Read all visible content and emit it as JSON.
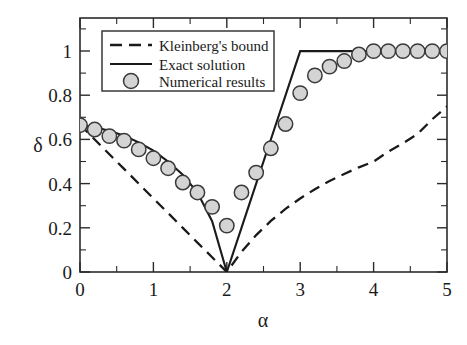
{
  "chart_data": {
    "type": "line",
    "title": "",
    "xlabel": "α",
    "ylabel": "δ",
    "xlim": [
      0,
      5
    ],
    "ylim": [
      0,
      1.15
    ],
    "grid": false,
    "legend_position": "top-left",
    "xticks": [
      0,
      1,
      2,
      3,
      4,
      5
    ],
    "xtick_labels": [
      "0",
      "1",
      "2",
      "3",
      "4",
      "5"
    ],
    "xminor_ticks": [
      0.5,
      1.5,
      2.5,
      3.5,
      4.5
    ],
    "yticks": [
      0,
      0.2,
      0.4,
      0.6,
      0.8,
      1
    ],
    "ytick_labels": [
      "0",
      "0.2",
      "0.4",
      "0.6",
      "0.8",
      "1"
    ],
    "yminor_ticks": [
      0.1,
      0.3,
      0.5,
      0.7,
      0.9,
      1.1
    ],
    "series": [
      {
        "name": "Kleinberg's bound",
        "style": "dashed",
        "color": "#1a1a1a",
        "x": [
          0,
          0.2,
          0.4,
          0.6,
          0.8,
          1.0,
          1.2,
          1.4,
          1.6,
          1.8,
          2.0,
          2.2,
          2.4,
          2.6,
          2.8,
          3.0,
          3.2,
          3.4,
          3.6,
          3.8,
          4.0,
          4.2,
          4.4,
          4.6,
          4.8,
          5.0
        ],
        "y": [
          0.667,
          0.6,
          0.533,
          0.467,
          0.4,
          0.333,
          0.267,
          0.2,
          0.133,
          0.067,
          0.0,
          0.091,
          0.167,
          0.231,
          0.286,
          0.333,
          0.375,
          0.412,
          0.444,
          0.474,
          0.5,
          0.545,
          0.583,
          0.625,
          0.692,
          0.75
        ]
      },
      {
        "name": "Exact solution",
        "style": "solid",
        "color": "#1a1a1a",
        "x": [
          0,
          0.2,
          0.4,
          0.6,
          0.8,
          1.0,
          1.2,
          1.4,
          1.6,
          1.8,
          2.0,
          2.2,
          2.4,
          2.6,
          2.8,
          3.0,
          3.5,
          4.0,
          4.5,
          5.0
        ],
        "y": [
          0.667,
          0.655,
          0.64,
          0.617,
          0.587,
          0.55,
          0.5,
          0.44,
          0.36,
          0.23,
          0.0,
          0.2,
          0.4,
          0.6,
          0.8,
          1.0,
          1.0,
          1.0,
          1.0,
          1.0
        ]
      },
      {
        "name": "Numerical results",
        "style": "markers",
        "marker": "circle",
        "marker_fill": "#d4d4d4",
        "marker_edge": "#3a3a3a",
        "x": [
          0.0,
          0.2,
          0.4,
          0.6,
          0.8,
          1.0,
          1.2,
          1.4,
          1.6,
          1.8,
          2.0,
          2.2,
          2.4,
          2.6,
          2.8,
          3.0,
          3.2,
          3.4,
          3.6,
          3.8,
          4.0,
          4.2,
          4.4,
          4.6,
          4.8,
          5.0
        ],
        "y": [
          0.665,
          0.645,
          0.615,
          0.595,
          0.555,
          0.515,
          0.47,
          0.405,
          0.36,
          0.295,
          0.21,
          0.36,
          0.45,
          0.56,
          0.67,
          0.81,
          0.89,
          0.93,
          0.955,
          0.985,
          1.0,
          1.0,
          1.0,
          1.0,
          1.0,
          1.0
        ]
      }
    ]
  },
  "legend": {
    "entries": [
      {
        "label": "Kleinberg's bound",
        "kind": "dashed-line"
      },
      {
        "label": "Exact solution",
        "kind": "solid-line"
      },
      {
        "label": "Numerical results",
        "kind": "circle-marker"
      }
    ]
  },
  "axes": {
    "x_title": "α",
    "y_title": "δ"
  }
}
